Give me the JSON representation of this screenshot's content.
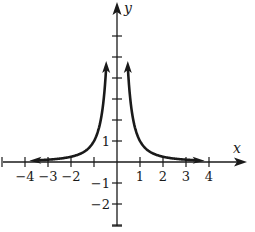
{
  "chart_data": {
    "type": "line",
    "title": "",
    "function": "y = 1/x^2",
    "xlabel": "x",
    "ylabel": "y",
    "xlim": [
      -5,
      5.7
    ],
    "ylim": [
      -3,
      7.5
    ],
    "x_ticks": [
      -5,
      -4,
      -3,
      -2,
      -1,
      0,
      1,
      2,
      3,
      4
    ],
    "x_tick_labels": [
      "-4",
      "-3",
      "-2",
      "1",
      "2",
      "3",
      "4"
    ],
    "x_tick_label_values": [
      -4,
      -3,
      -2,
      1,
      2,
      3,
      4
    ],
    "y_ticks": [
      -3,
      -2,
      -1,
      1,
      2,
      3,
      4,
      5,
      6
    ],
    "y_tick_labels": [
      "1",
      "-1",
      "-2"
    ],
    "y_tick_label_values": [
      1,
      -1,
      -2
    ],
    "grid": false,
    "legend": null,
    "series": [
      {
        "name": "left branch",
        "x": [
          -3.7,
          -3,
          -2,
          -1.5,
          -1,
          -0.75,
          -0.6,
          -0.5,
          -0.45
        ],
        "values": [
          0.073,
          0.111,
          0.25,
          0.444,
          1,
          1.778,
          2.778,
          4,
          4.94
        ],
        "arrows": "both ends"
      },
      {
        "name": "right branch",
        "x": [
          0.45,
          0.5,
          0.6,
          0.75,
          1,
          1.5,
          2,
          3,
          3.7
        ],
        "values": [
          4.94,
          4,
          2.778,
          1.778,
          1,
          0.444,
          0.25,
          0.111,
          0.073
        ],
        "arrows": "both ends"
      }
    ],
    "annotations": [
      "vertical asymptote x = 0",
      "horizontal asymptote y = 0"
    ],
    "colors": {
      "curve": "#1a1a1a",
      "axes": "#1a1a1a",
      "background": "#ffffff"
    }
  }
}
